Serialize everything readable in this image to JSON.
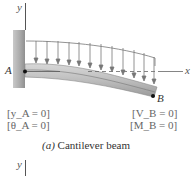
{
  "figure": {
    "axes": {
      "y_label": "y",
      "x_label": "x"
    },
    "points": {
      "a": "A",
      "b": "B"
    },
    "boundary_conditions": {
      "left": [
        "[y_A = 0]",
        "[θ_A = 0]"
      ],
      "right": [
        "[V_B = 0]",
        "[M_B = 0]"
      ]
    },
    "caption_prefix": "(a)",
    "caption_text": "Cantilever beam",
    "bottom_axis_label": "y"
  }
}
